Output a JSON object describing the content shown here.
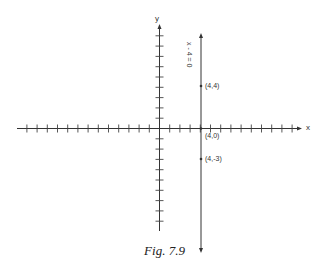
{
  "figure": {
    "caption": "Fig. 7.9",
    "axes": {
      "x_label": "x",
      "y_label": "y"
    },
    "line": {
      "equation": "x - 4 = 0",
      "x": 4
    },
    "points": [
      {
        "label": "(4,4)",
        "x": 4,
        "y": 4
      },
      {
        "label": "(4,0)",
        "x": 4,
        "y": 0
      },
      {
        "label": "(4,-3)",
        "x": 4,
        "y": -3
      }
    ],
    "ticks": {
      "x_negative_count": 13,
      "x_positive_count": 13,
      "y_positive_count": 9,
      "y_negative_count": 9
    }
  }
}
